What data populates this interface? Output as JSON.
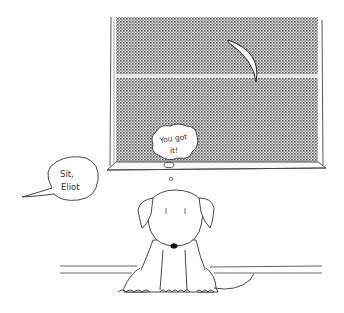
{
  "scene": {
    "type": "cartoon-illustration",
    "background": "#ffffff",
    "line_color": "#3a3a3a",
    "window": {
      "pane_color": "#8a8a8a",
      "moon": "crescent-moon"
    },
    "speech_bubble": {
      "line1": "Sit,",
      "line2": "Eliot"
    },
    "thought_bubble": {
      "line1": "You got",
      "line2": "it!"
    },
    "character": "puppy-sitting"
  }
}
